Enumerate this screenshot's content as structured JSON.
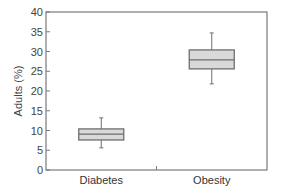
{
  "chart_data": {
    "type": "box",
    "title": "",
    "xlabel": "",
    "ylabel": "Adults (%)",
    "ylim": [
      0,
      40
    ],
    "yticks": [
      0,
      5,
      10,
      15,
      20,
      25,
      30,
      35,
      40
    ],
    "grid": false,
    "legend": null,
    "categories": [
      "Diabetes",
      "Obesity"
    ],
    "series": [
      {
        "name": "Diabetes",
        "whisker_low": 5.6,
        "q1": 7.6,
        "median": 9.1,
        "q3": 10.4,
        "whisker_high": 13.2
      },
      {
        "name": "Obesity",
        "whisker_low": 21.8,
        "q1": 25.6,
        "median": 27.9,
        "q3": 30.4,
        "whisker_high": 34.7
      }
    ],
    "colors": {
      "box_fill": "#d9d9d9",
      "box_stroke": "#6e6e6e",
      "axis": "#7a7a7a",
      "whisker": "#6e6e6e"
    }
  }
}
